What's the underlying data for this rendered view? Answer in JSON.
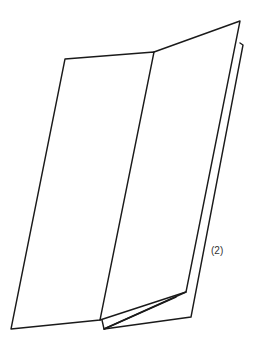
{
  "diagram": {
    "label": "(2)",
    "stroke_color": "#1a1a1a",
    "background": "#ffffff"
  }
}
